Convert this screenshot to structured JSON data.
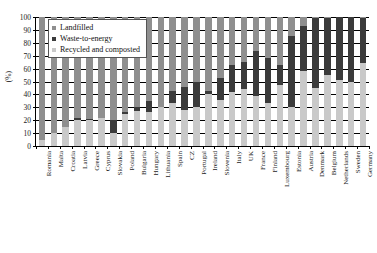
{
  "chart_data": {
    "type": "bar",
    "subtype": "stacked-100-percent",
    "title": "",
    "xlabel": "",
    "ylabel": "(%)",
    "ylim": [
      0,
      100
    ],
    "yticks": [
      0,
      10,
      20,
      30,
      40,
      50,
      60,
      70,
      80,
      90,
      100
    ],
    "grid": true,
    "legend_position": "top-left",
    "categories": [
      "Romania",
      "Malta",
      "Croatia",
      "Latvia",
      "Greece",
      "Cyprus",
      "Slovakia",
      "Poland",
      "Bulgaria",
      "Hungary",
      "Lithuania",
      "Spain",
      "CZ",
      "Portugal",
      "Ireland",
      "Slovenia",
      "Italy",
      "UK",
      "France",
      "Finland",
      "Luxembourg",
      "Estonia",
      "Austria",
      "Denmark",
      "Belgium",
      "Netherlands",
      "Sweden",
      "Germany"
    ],
    "series": [
      {
        "name": "Recycled and composted",
        "color": "#c9c9c9",
        "values": [
          5,
          10,
          15,
          20,
          20,
          22,
          10,
          25,
          27,
          26,
          30,
          33,
          28,
          30,
          40,
          36,
          42,
          44,
          39,
          33,
          47,
          30,
          58,
          45,
          55,
          51,
          50,
          64
        ]
      },
      {
        "name": "Waste-to-energy",
        "color": "#3b3b3b",
        "values": [
          0,
          0,
          0,
          2,
          1,
          0,
          10,
          1,
          3,
          9,
          0,
          10,
          18,
          20,
          3,
          17,
          21,
          21,
          35,
          35,
          16,
          55,
          35,
          54,
          44,
          49,
          50,
          35
        ]
      },
      {
        "name": "Landfilled",
        "color": "#8f8f8f",
        "values": [
          95,
          90,
          85,
          78,
          79,
          78,
          80,
          74,
          70,
          65,
          70,
          57,
          54,
          50,
          57,
          47,
          37,
          35,
          26,
          32,
          37,
          15,
          7,
          1,
          1,
          0,
          0,
          1
        ]
      }
    ]
  },
  "legend": {
    "items": [
      {
        "label": "Landfilled",
        "key": "lf"
      },
      {
        "label": "Waste-to-energy",
        "key": "wte"
      },
      {
        "label": "Recycled and composted",
        "key": "rec"
      }
    ]
  }
}
